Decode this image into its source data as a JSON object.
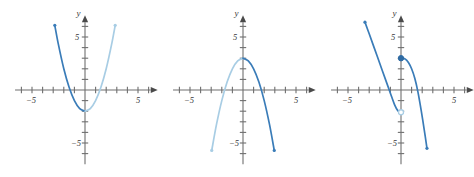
{
  "figure": {
    "background_color": "#ffffff",
    "panel_count": 3,
    "axis_color": "#6f6f6f",
    "curve_dark_color": "#3a7cb8",
    "curve_light_color": "#a8cde4"
  },
  "chart_data": [
    {
      "type": "line",
      "title": "",
      "xlabel": "x",
      "ylabel": "y",
      "xlim": [
        -7,
        7
      ],
      "ylim": [
        -7,
        7
      ],
      "xticks": [
        -6,
        -5,
        -4,
        -3,
        -2,
        -1,
        1,
        2,
        3,
        4,
        5,
        6
      ],
      "yticks": [
        -6,
        -5,
        -4,
        -3,
        -2,
        -1,
        1,
        2,
        3,
        4,
        5,
        6
      ],
      "xtick_labels": [
        {
          "value": -5,
          "text": "−5"
        },
        {
          "value": 5,
          "text": "5"
        }
      ],
      "ytick_labels": [
        {
          "value": -5,
          "text": "−5"
        },
        {
          "value": 5,
          "text": "5"
        }
      ],
      "grid": false,
      "legend": "none",
      "description": "Upward-opening parabola with vertex near (0, -2)",
      "series": [
        {
          "name": "left-branch",
          "color": "#3a7cb8",
          "style": "solid",
          "points": [
            {
              "x": -2.85,
              "y": 6.1
            },
            {
              "x": -2.5,
              "y": 4.25
            },
            {
              "x": -2.0,
              "y": 2.0
            },
            {
              "x": -1.5,
              "y": 0.25
            },
            {
              "x": -1.0,
              "y": -1.0
            },
            {
              "x": -0.5,
              "y": -1.75
            },
            {
              "x": 0.0,
              "y": -2.0
            }
          ]
        },
        {
          "name": "right-branch",
          "color": "#a8cde4",
          "style": "solid",
          "points": [
            {
              "x": 0.0,
              "y": -2.0
            },
            {
              "x": 0.5,
              "y": -1.75
            },
            {
              "x": 1.0,
              "y": -1.0
            },
            {
              "x": 1.5,
              "y": 0.25
            },
            {
              "x": 2.0,
              "y": 2.0
            },
            {
              "x": 2.5,
              "y": 4.25
            },
            {
              "x": 2.85,
              "y": 6.1
            }
          ]
        }
      ]
    },
    {
      "type": "line",
      "title": "",
      "xlabel": "x",
      "ylabel": "y",
      "xlim": [
        -7,
        7
      ],
      "ylim": [
        -7,
        7
      ],
      "xticks": [
        -6,
        -5,
        -4,
        -3,
        -2,
        -1,
        1,
        2,
        3,
        4,
        5,
        6
      ],
      "yticks": [
        -6,
        -5,
        -4,
        -3,
        -2,
        -1,
        1,
        2,
        3,
        4,
        5,
        6
      ],
      "xtick_labels": [
        {
          "value": -5,
          "text": "−5"
        },
        {
          "value": 5,
          "text": "5"
        }
      ],
      "ytick_labels": [
        {
          "value": -5,
          "text": "−5"
        },
        {
          "value": 5,
          "text": "5"
        }
      ],
      "grid": false,
      "legend": "none",
      "description": "Downward-opening parabola with vertex near (0, 3)",
      "series": [
        {
          "name": "left-branch",
          "color": "#a8cde4",
          "style": "solid",
          "points": [
            {
              "x": 0.0,
              "y": 3.0
            },
            {
              "x": -0.5,
              "y": 2.75
            },
            {
              "x": -1.0,
              "y": 2.0
            },
            {
              "x": -1.5,
              "y": 0.75
            },
            {
              "x": -2.0,
              "y": -1.0
            },
            {
              "x": -2.5,
              "y": -3.25
            },
            {
              "x": -2.95,
              "y": -5.7
            }
          ]
        },
        {
          "name": "right-branch",
          "color": "#3a7cb8",
          "style": "solid",
          "points": [
            {
              "x": 0.0,
              "y": 3.0
            },
            {
              "x": 0.5,
              "y": 2.75
            },
            {
              "x": 1.0,
              "y": 2.0
            },
            {
              "x": 1.5,
              "y": 0.75
            },
            {
              "x": 2.0,
              "y": -1.0
            },
            {
              "x": 2.5,
              "y": -3.25
            },
            {
              "x": 2.95,
              "y": -5.7
            }
          ]
        }
      ]
    },
    {
      "type": "line",
      "title": "",
      "xlabel": "x",
      "ylabel": "y",
      "xlim": [
        -7,
        7
      ],
      "ylim": [
        -7,
        7
      ],
      "xticks": [
        -6,
        -5,
        -4,
        -3,
        -2,
        -1,
        1,
        2,
        3,
        4,
        5,
        6
      ],
      "yticks": [
        -6,
        -5,
        -4,
        -3,
        -2,
        -1,
        1,
        2,
        3,
        4,
        5,
        6
      ],
      "xtick_labels": [
        {
          "value": -5,
          "text": "−5"
        },
        {
          "value": 5,
          "text": "5"
        }
      ],
      "ytick_labels": [
        {
          "value": -5,
          "text": "−5"
        },
        {
          "value": 5,
          "text": "5"
        }
      ],
      "grid": false,
      "legend": "none",
      "description": "Piecewise curve: descending branch from upper left ending at open circle (0, -2); second branch starting at filled point (0, 3) descending to lower right",
      "series": [
        {
          "name": "left-branch",
          "color": "#3a7cb8",
          "style": "solid",
          "points": [
            {
              "x": -3.4,
              "y": 6.4
            },
            {
              "x": -3.0,
              "y": 5.3
            },
            {
              "x": -2.5,
              "y": 3.9
            },
            {
              "x": -2.0,
              "y": 2.5
            },
            {
              "x": -1.5,
              "y": 1.1
            },
            {
              "x": -1.0,
              "y": -0.3
            },
            {
              "x": -0.6,
              "y": -1.4
            },
            {
              "x": -0.3,
              "y": -1.95
            },
            {
              "x": 0.0,
              "y": -2.1
            }
          ]
        },
        {
          "name": "right-branch",
          "color": "#3a7cb8",
          "style": "solid",
          "points": [
            {
              "x": 0.0,
              "y": 3.0
            },
            {
              "x": 0.35,
              "y": 2.95
            },
            {
              "x": 0.7,
              "y": 2.6
            },
            {
              "x": 1.0,
              "y": 2.0
            },
            {
              "x": 1.3,
              "y": 1.1
            },
            {
              "x": 1.6,
              "y": -0.2
            },
            {
              "x": 1.9,
              "y": -1.9
            },
            {
              "x": 2.2,
              "y": -3.8
            },
            {
              "x": 2.45,
              "y": -5.5
            }
          ]
        }
      ],
      "markers": [
        {
          "name": "closed-point",
          "x": 0.0,
          "y": 3.0,
          "style": "filled",
          "color": "#2f6ba3"
        },
        {
          "name": "open-point",
          "x": 0.0,
          "y": -2.1,
          "style": "open",
          "color": "#a8cde4"
        }
      ]
    }
  ]
}
